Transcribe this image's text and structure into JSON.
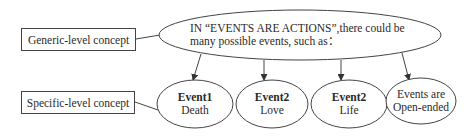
{
  "generic_box": {
    "label": "Generic-level concept"
  },
  "specific_box": {
    "label": "Specific-level concept"
  },
  "top_node": {
    "line1": "IN “EVENTS ARE ACTIONS”,there could be",
    "line2": "many possible events, such as："
  },
  "events": [
    {
      "title": "Event1",
      "subtitle": "Death"
    },
    {
      "title": "Event2",
      "subtitle": "Love"
    },
    {
      "title": "Event2",
      "subtitle": "Life"
    },
    {
      "title": "Events are",
      "subtitle": "Open-ended"
    }
  ],
  "colors": {
    "stroke": "#444444",
    "text": "#2a2a2a",
    "background": "#ffffff"
  }
}
